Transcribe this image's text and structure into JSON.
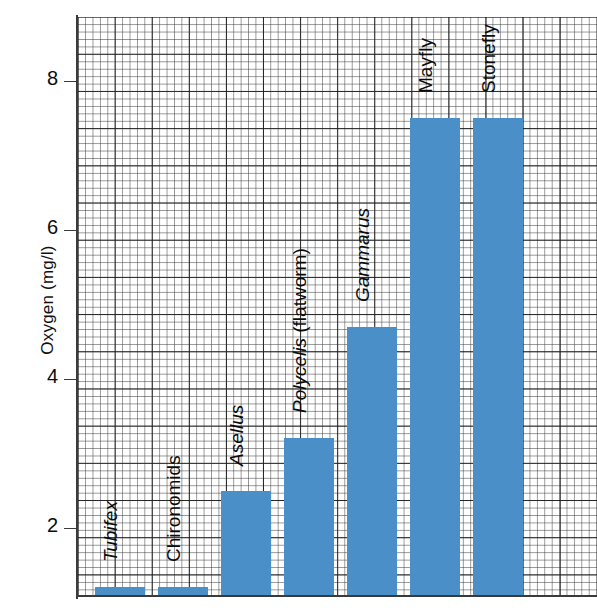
{
  "chart_data": {
    "type": "bar",
    "title": "",
    "xlabel": "",
    "ylabel": "Oxygen (mg/l)",
    "ylim": [
      1.07,
      8.86
    ],
    "yticks": [
      2,
      4,
      6,
      8
    ],
    "ytick_labels": [
      "2",
      "4",
      "6",
      "8"
    ],
    "grid": true,
    "grid_style": "graph-paper",
    "legend": "none",
    "bar_color": "#4b8fc9",
    "categories": [
      "Tubifex",
      "Chironomids",
      "Asellus",
      "Polycelis (flatworm)",
      "Gammarus",
      "Mayfly",
      "Stonefly"
    ],
    "values": [
      1.2,
      1.2,
      2.5,
      3.2,
      4.7,
      7.5,
      7.5
    ],
    "bars": [
      {
        "label_sci": "Tubifex",
        "label_common": "",
        "italic": true,
        "value": 1.2
      },
      {
        "label_sci": "",
        "label_common": "Chironomids",
        "italic": false,
        "value": 1.2
      },
      {
        "label_sci": "Asellus",
        "label_common": "",
        "italic": true,
        "value": 2.5
      },
      {
        "label_sci": "Polycelis",
        "label_common": " (flatworm)",
        "italic": true,
        "value": 3.2
      },
      {
        "label_sci": "Gammarus",
        "label_common": "",
        "italic": true,
        "value": 4.7
      },
      {
        "label_sci": "",
        "label_common": "Mayfly",
        "italic": false,
        "value": 7.5
      },
      {
        "label_sci": "",
        "label_common": "Stonefly",
        "italic": false,
        "value": 7.5
      }
    ]
  },
  "axis": {
    "y_title": "Oxygen (mg/l)",
    "ticks": [
      "8",
      "6",
      "4",
      "2"
    ]
  }
}
